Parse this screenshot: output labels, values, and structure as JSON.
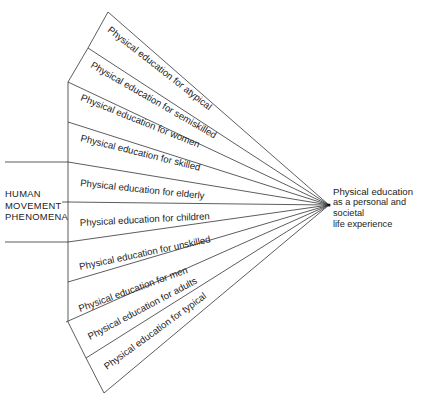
{
  "diagram": {
    "source": {
      "label_lines": [
        "HUMAN",
        "MOVEMENT",
        "PHENOMENA"
      ]
    },
    "target": {
      "title": "Physical education",
      "subtitle_lines": [
        "as a personal and societal",
        "life experience"
      ]
    },
    "wedges": [
      {
        "label": "Physical education for atypical"
      },
      {
        "label": "Physical education for semiskilled"
      },
      {
        "label": "Physical education for women"
      },
      {
        "label": "Physical education for skilled"
      },
      {
        "label": "Physical education for elderly"
      },
      {
        "label": "Physical education for children"
      },
      {
        "label": "Physical education for unskilled"
      },
      {
        "label": "Physical education for men"
      },
      {
        "label": "Physical education for adults"
      },
      {
        "label": "Physical education for typical"
      }
    ],
    "colors": {
      "line": "#333333",
      "text": "#222222",
      "background": "#ffffff"
    }
  }
}
